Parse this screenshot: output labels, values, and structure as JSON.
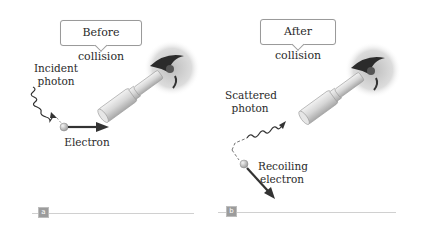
{
  "figure": {
    "panels": [
      {
        "id": "a",
        "tag": "a",
        "bubble": "Before collision",
        "photon_label": [
          "Incident",
          "photon"
        ],
        "electron_label": "Electron"
      },
      {
        "id": "b",
        "tag": "b",
        "bubble": "After collision",
        "photon_label": [
          "Scattered",
          "photon"
        ],
        "electron_label": [
          "Recoiling",
          "electron"
        ]
      }
    ],
    "colors": {
      "arrow": "#333333",
      "electron": "#c8c8c8",
      "bubble_border": "#9a9a9a",
      "rule": "#d0d0d0",
      "tag_bg": "#9c9c9c"
    }
  }
}
